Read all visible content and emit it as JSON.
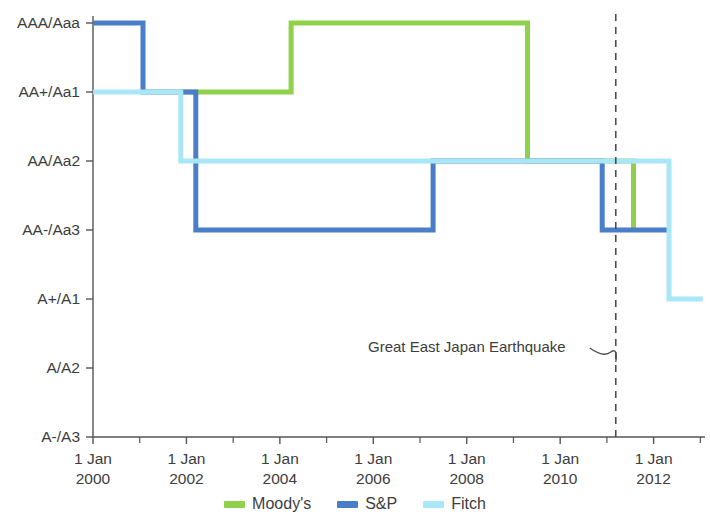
{
  "chart_data": {
    "type": "line",
    "title": "",
    "subtitle": "",
    "xlabel": "",
    "ylabel": "",
    "step_style": "post",
    "grid": false,
    "legend_position": "bottom-center",
    "y_categories": [
      "AAA/Aaa",
      "AA+/Aa1",
      "AA/Aa2",
      "AA-/Aa3",
      "A+/A1",
      "A/A2",
      "A-/A3"
    ],
    "y_tick_labels": [
      "AAA/Aaa",
      "AA+/Aa1",
      "AA/Aa2",
      "AA-/Aa3",
      "A+/A1",
      "A/A2",
      "A-/A3"
    ],
    "x_tick_labels": [
      {
        "line1": "1 Jan",
        "line2": "2000",
        "value": 2000.0
      },
      {
        "line1": "1 Jan",
        "line2": "2002",
        "value": 2002.0
      },
      {
        "line1": "1 Jan",
        "line2": "2004",
        "value": 2004.0
      },
      {
        "line1": "1 Jan",
        "line2": "2006",
        "value": 2006.0
      },
      {
        "line1": "1 Jan",
        "line2": "2008",
        "value": 2008.0
      },
      {
        "line1": "1 Jan",
        "line2": "2010",
        "value": 2010.0
      },
      {
        "line1": "1 Jan",
        "line2": "2012",
        "value": 2012.0
      }
    ],
    "x_minor_ticks": [
      2001.0,
      2003.0,
      2005.0,
      2007.0,
      2009.0,
      2011.0,
      2013.0
    ],
    "xlim": [
      2000.0,
      2013.1
    ],
    "ylim": [
      "A-/A3",
      "AAA/Aaa"
    ],
    "series": [
      {
        "name": "Moody's",
        "color": "#8fd14a",
        "points": [
          {
            "x": 2001.88,
            "y": "AA+/Aa1"
          },
          {
            "x": 2004.24,
            "y": "AA+/Aa1"
          },
          {
            "x": 2004.24,
            "y": "AAA/Aaa"
          },
          {
            "x": 2009.3,
            "y": "AAA/Aaa"
          },
          {
            "x": 2009.3,
            "y": "AA/Aa2"
          },
          {
            "x": 2011.57,
            "y": "AA/Aa2"
          },
          {
            "x": 2011.57,
            "y": "AA-/Aa3"
          }
        ]
      },
      {
        "name": "S&P",
        "color": "#4a7ec8",
        "points": [
          {
            "x": 2000.0,
            "y": "AAA/Aaa"
          },
          {
            "x": 2001.07,
            "y": "AAA/Aaa"
          },
          {
            "x": 2001.07,
            "y": "AA+/Aa1"
          },
          {
            "x": 2002.2,
            "y": "AA+/Aa1"
          },
          {
            "x": 2002.2,
            "y": "AA-/Aa3"
          },
          {
            "x": 2007.28,
            "y": "AA-/Aa3"
          },
          {
            "x": 2007.28,
            "y": "AA/Aa2"
          },
          {
            "x": 2010.9,
            "y": "AA/Aa2"
          },
          {
            "x": 2010.9,
            "y": "AA-/Aa3"
          },
          {
            "x": 2012.33,
            "y": "AA-/Aa3"
          }
        ]
      },
      {
        "name": "Fitch",
        "color": "#a9e6f7",
        "points": [
          {
            "x": 2000.0,
            "y": "AA+/Aa1"
          },
          {
            "x": 2001.88,
            "y": "AA+/Aa1"
          },
          {
            "x": 2001.88,
            "y": "AA/Aa2"
          },
          {
            "x": 2012.33,
            "y": "AA/Aa2"
          },
          {
            "x": 2012.33,
            "y": "A+/A1"
          },
          {
            "x": 2013.05,
            "y": "A+/A1"
          }
        ]
      }
    ],
    "annotations": [
      {
        "text": "Great East Japan Earthquake",
        "x": 2011.19,
        "style": "dashed-vertical-line-with-leader",
        "line_color": "#4d4d4d"
      }
    ],
    "legend": [
      {
        "label": "Moody's",
        "color": "#8fd14a"
      },
      {
        "label": "S&P",
        "color": "#4a7ec8"
      },
      {
        "label": "Fitch",
        "color": "#a9e6f7"
      }
    ],
    "axis_color": "#555555"
  }
}
